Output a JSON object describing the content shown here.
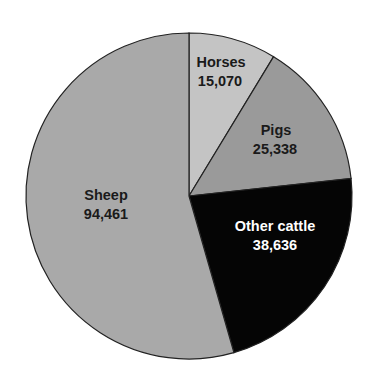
{
  "chart_data": {
    "type": "pie",
    "title": "",
    "start_angle_deg": 0,
    "direction": "clockwise",
    "slices": [
      {
        "label": "Horses",
        "value": 15070,
        "value_label": "15,070",
        "color": "#c4c4c4",
        "text_color": "#1a1a1a"
      },
      {
        "label": "Pigs",
        "value": 25338,
        "value_label": "25,338",
        "color": "#9a9a9a",
        "text_color": "#1a1a1a"
      },
      {
        "label": "Other cattle",
        "value": 38636,
        "value_label": "38,636",
        "color": "#050505",
        "text_color": "#ffffff"
      },
      {
        "label": "Sheep",
        "value": 94461,
        "value_label": "94,461",
        "color": "#a9a9a9",
        "text_color": "#1a1a1a"
      }
    ],
    "categories": [
      "Horses",
      "Pigs",
      "Other cattle",
      "Sheep"
    ],
    "values": [
      15070,
      25338,
      38636,
      94461
    ]
  },
  "labels": {
    "horses": {
      "name": "Horses",
      "value": "15,070"
    },
    "pigs": {
      "name": "Pigs",
      "value": "25,338"
    },
    "cattle": {
      "name": "Other cattle",
      "value": "38,636"
    },
    "sheep": {
      "name": "Sheep",
      "value": "94,461"
    }
  }
}
